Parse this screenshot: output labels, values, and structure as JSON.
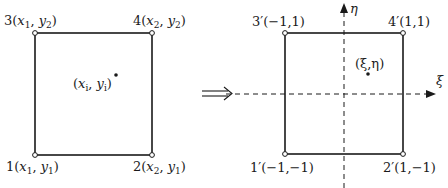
{
  "left_panel": {
    "corners": [
      {
        "id": "1",
        "label": "1(x1,y1)",
        "num": "1",
        "x": "x",
        "xs": "1",
        "y": "y",
        "ys": "1"
      },
      {
        "id": "2",
        "label": "2(x2,y1)",
        "num": "2",
        "x": "x",
        "xs": "2",
        "y": "y",
        "ys": "1"
      },
      {
        "id": "3",
        "label": "3(x1,y2)",
        "num": "3",
        "x": "x",
        "xs": "1",
        "y": "y",
        "ys": "2"
      },
      {
        "id": "4",
        "label": "4(x2,y2)",
        "num": "4",
        "x": "x",
        "xs": "2",
        "y": "y",
        "ys": "2"
      }
    ],
    "point": {
      "label": "(xi,yi)",
      "x": "x",
      "xs": "i",
      "y": "y",
      "ys": "i"
    }
  },
  "arrow": {
    "symbol": "⟹"
  },
  "right_panel": {
    "corners": [
      {
        "id": "1'",
        "label": "1′(−1,−1)"
      },
      {
        "id": "2'",
        "label": "2′(1,−1)"
      },
      {
        "id": "3'",
        "label": "3′(−1,1)"
      },
      {
        "id": "4'",
        "label": "4′(1,1)"
      }
    ],
    "point": {
      "label": "(ξ,η)"
    },
    "axes": {
      "horizontal": "ξ",
      "vertical": "η"
    }
  },
  "colors": {
    "line": "#1a1a1a",
    "background": "#ffffff"
  }
}
